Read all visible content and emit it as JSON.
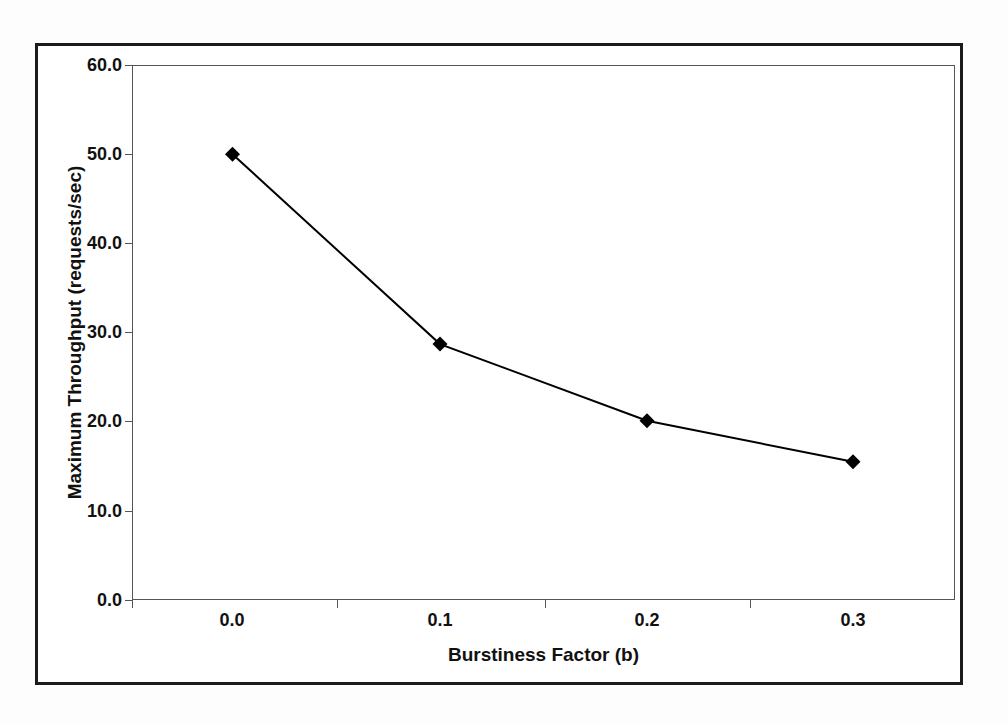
{
  "chart_data": {
    "type": "line",
    "title": "",
    "xlabel": "Burstiness Factor (b)",
    "ylabel": "Maximum Throughput (requests/sec)",
    "x": [
      0.0,
      0.1,
      0.2,
      0.3
    ],
    "values": [
      50.0,
      28.7,
      20.1,
      15.5
    ],
    "xtick_labels": [
      "0.0",
      "0.1",
      "0.2",
      "0.3"
    ],
    "ytick_labels": [
      "0.0",
      "10.0",
      "20.0",
      "30.0",
      "40.0",
      "50.0",
      "60.0"
    ],
    "ytick_values": [
      0.0,
      10.0,
      20.0,
      30.0,
      40.0,
      50.0,
      60.0
    ],
    "xlim": [
      0.0,
      0.4
    ],
    "ylim": [
      0.0,
      60.0
    ],
    "grid": false,
    "legend": "none",
    "marker": "diamond",
    "marker_color": "#000000",
    "line_color": "#000000"
  },
  "axes": {
    "y_title": "Maximum Throughput (requests/sec)",
    "x_title": "Burstiness Factor (b)",
    "y_labels": {
      "t0": "0.0",
      "t1": "10.0",
      "t2": "20.0",
      "t3": "30.0",
      "t4": "40.0",
      "t5": "50.0",
      "t6": "60.0"
    },
    "x_labels": {
      "t0": "0.0",
      "t1": "0.1",
      "t2": "0.2",
      "t3": "0.3"
    }
  }
}
